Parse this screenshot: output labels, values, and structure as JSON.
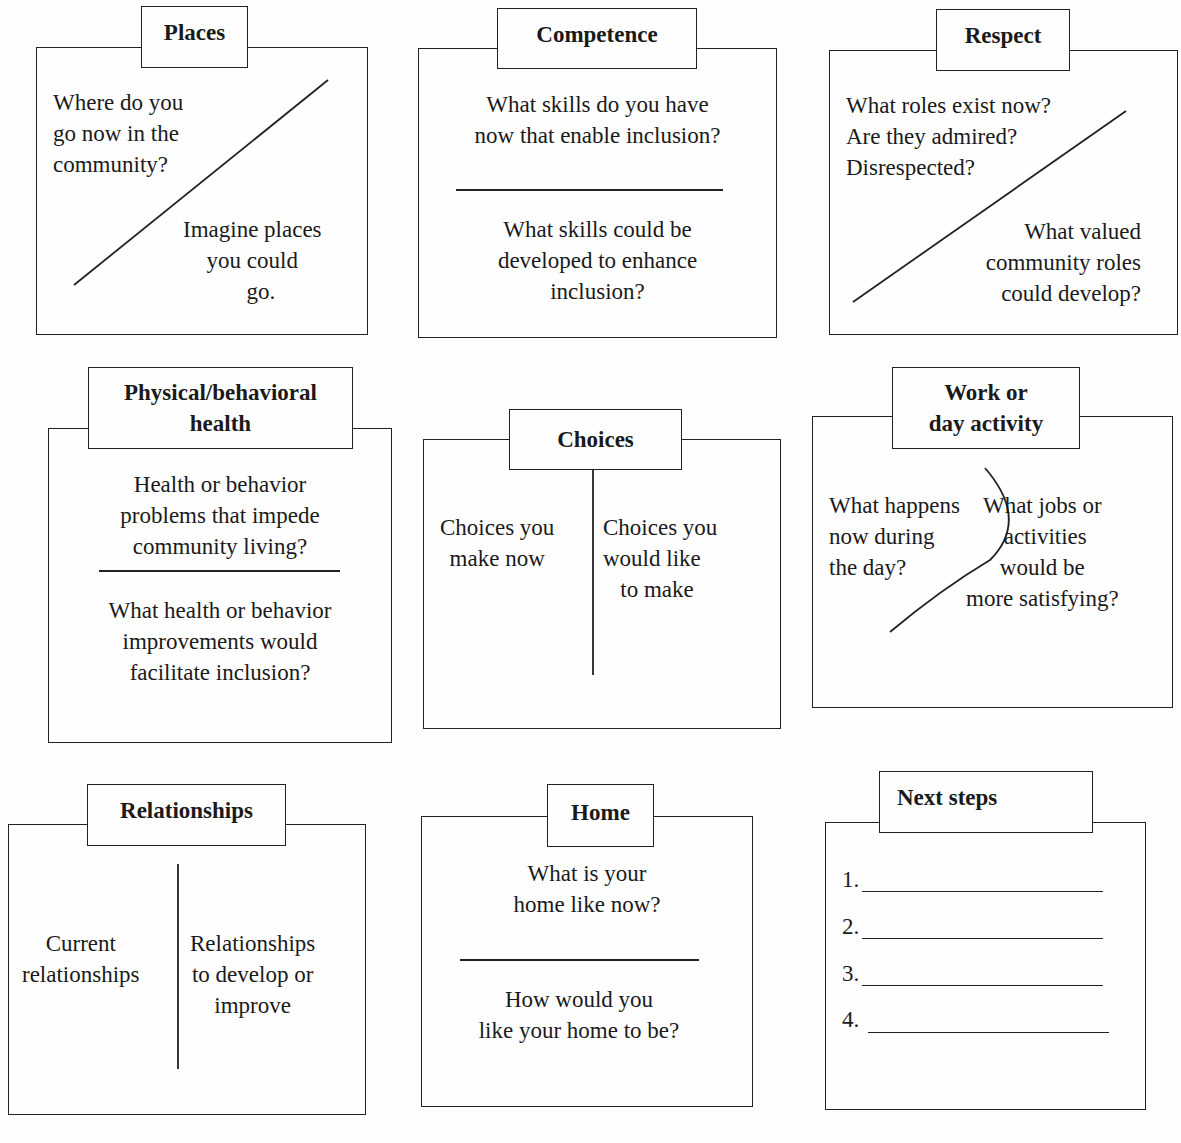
{
  "panels": {
    "places": {
      "title": "Places",
      "current": "Where do you\ngo now in the\ncommunity?",
      "future": "Imagine places\nyou could\n   go."
    },
    "competence": {
      "title": "Competence",
      "current": "What skills do you have\nnow that enable inclusion?",
      "future": "What skills could be\ndeveloped to enhance\ninclusion?"
    },
    "respect": {
      "title": "Respect",
      "current": "What roles exist now?\nAre they admired?\nDisrespected?",
      "future": "What valued\ncommunity roles\ncould develop?"
    },
    "health": {
      "title": "Physical/behavioral\nhealth",
      "current": "Health or behavior\nproblems that impede\ncommunity living?",
      "future": "What health or behavior\nimprovements would\nfacilitate inclusion?"
    },
    "choices": {
      "title": "Choices",
      "current": "Choices you\nmake now",
      "future": "Choices you\nwould like\n   to make"
    },
    "work": {
      "title": "Work or\nday activity",
      "current": "What happens\nnow during\nthe day?",
      "future": "What jobs or\n activities\nwould be\nmore satisfying?"
    },
    "relationships": {
      "title": "Relationships",
      "current": "Current\nrelationships",
      "future": "Relationships\nto develop or\nimprove"
    },
    "home": {
      "title": "Home",
      "current": "What is your\nhome like now?",
      "future": "How would you\nlike your home to be?"
    },
    "next_steps": {
      "title": "Next steps",
      "items": [
        "1.",
        "2.",
        "3.",
        "4."
      ]
    }
  }
}
